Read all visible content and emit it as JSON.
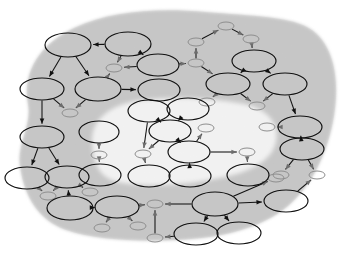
{
  "diagram": {
    "type": "node-link-diagram",
    "width": 352,
    "height": 258,
    "colors": {
      "background": "#ffffff",
      "region_fill": "#c9c9c9",
      "region_inner_fill": "#ffffff",
      "node_stroke": "#101010",
      "node_fill": "none",
      "leaf_stroke": "#8e8e8e",
      "edge_stroke": "#111111"
    },
    "regions": [
      {
        "name": "outer-shaded-region",
        "fill": "#c9c9c9",
        "path": "M 28 104 C 22 72, 40 44, 74 28 C 112 10, 160 8, 206 12 C 252 16, 292 16, 312 30 C 334 46, 340 80, 334 116 C 328 152, 312 186, 288 206 C 262 228, 222 238, 178 240 C 136 242, 96 240, 66 230 C 38 220, 24 196, 20 166 C 17 142, 32 126, 28 104 Z"
      },
      {
        "name": "inner-white-region",
        "fill": "#ffffff",
        "path": "M 92 140 C 92 118, 112 104, 142 100 C 176 96, 214 98, 244 104 C 268 109, 280 124, 276 142 C 272 160, 252 172, 220 178 C 186 185, 146 188, 118 182 C 98 178, 92 160, 92 140 Z"
      }
    ],
    "nodes": [
      {
        "id": "n1",
        "name": "node-top-left",
        "cx": 68,
        "cy": 45,
        "rx": 23,
        "ry": 12,
        "kind": "ellipse"
      },
      {
        "id": "n2",
        "name": "node-top-center",
        "cx": 128,
        "cy": 44,
        "rx": 23,
        "ry": 12,
        "kind": "ellipse"
      },
      {
        "id": "n3",
        "name": "leaf-top-center",
        "cx": 114,
        "cy": 68,
        "rx": 8,
        "ry": 4,
        "kind": "leaf"
      },
      {
        "id": "n4",
        "name": "node-upper-mid",
        "cx": 158,
        "cy": 65,
        "rx": 21,
        "ry": 11,
        "kind": "ellipse"
      },
      {
        "id": "n5",
        "name": "node-left-upper",
        "cx": 42,
        "cy": 89,
        "rx": 22,
        "ry": 11,
        "kind": "ellipse"
      },
      {
        "id": "n6",
        "name": "node-mid-left",
        "cx": 98,
        "cy": 89,
        "rx": 23,
        "ry": 12,
        "kind": "ellipse"
      },
      {
        "id": "n7",
        "name": "node-mid-right",
        "cx": 159,
        "cy": 90,
        "rx": 21,
        "ry": 11,
        "kind": "ellipse"
      },
      {
        "id": "n8",
        "name": "leaf-left-upper",
        "cx": 70,
        "cy": 113,
        "rx": 8,
        "ry": 4,
        "kind": "leaf"
      },
      {
        "id": "n9",
        "name": "leaf-top-right-a",
        "cx": 196,
        "cy": 42,
        "rx": 8,
        "ry": 4,
        "kind": "leaf"
      },
      {
        "id": "n10",
        "name": "leaf-top-right-b",
        "cx": 226,
        "cy": 26,
        "rx": 8,
        "ry": 4,
        "kind": "leaf"
      },
      {
        "id": "n11",
        "name": "leaf-top-right-c",
        "cx": 251,
        "cy": 39,
        "rx": 8,
        "ry": 4,
        "kind": "leaf"
      },
      {
        "id": "n12",
        "name": "leaf-right-upper",
        "cx": 196,
        "cy": 63,
        "rx": 8,
        "ry": 4,
        "kind": "leaf"
      },
      {
        "id": "n13",
        "name": "node-right-top",
        "cx": 254,
        "cy": 61,
        "rx": 22,
        "ry": 11,
        "kind": "ellipse"
      },
      {
        "id": "n14",
        "name": "node-right-mid-a",
        "cx": 228,
        "cy": 84,
        "rx": 22,
        "ry": 11,
        "kind": "ellipse"
      },
      {
        "id": "n15",
        "name": "node-right-mid-b",
        "cx": 285,
        "cy": 84,
        "rx": 22,
        "ry": 11,
        "kind": "ellipse"
      },
      {
        "id": "n16",
        "name": "leaf-right-mid-a",
        "cx": 207,
        "cy": 102,
        "rx": 8,
        "ry": 4,
        "kind": "leaf"
      },
      {
        "id": "n17",
        "name": "leaf-right-mid-b",
        "cx": 257,
        "cy": 106,
        "rx": 8,
        "ry": 4,
        "kind": "leaf"
      },
      {
        "id": "n18",
        "name": "node-right-lower-a",
        "cx": 300,
        "cy": 127,
        "rx": 22,
        "ry": 11,
        "kind": "ellipse"
      },
      {
        "id": "n19",
        "name": "leaf-right-lower",
        "cx": 267,
        "cy": 127,
        "rx": 8,
        "ry": 4,
        "kind": "leaf"
      },
      {
        "id": "n20",
        "name": "node-right-lower-b",
        "cx": 302,
        "cy": 149,
        "rx": 22,
        "ry": 11,
        "kind": "ellipse"
      },
      {
        "id": "n21",
        "name": "leaf-right-bottom-a",
        "cx": 281,
        "cy": 175,
        "rx": 8,
        "ry": 4,
        "kind": "leaf"
      },
      {
        "id": "n22",
        "name": "leaf-right-bottom-b",
        "cx": 317,
        "cy": 175,
        "rx": 8,
        "ry": 4,
        "kind": "leaf"
      },
      {
        "id": "n23",
        "name": "node-bottom-right",
        "cx": 286,
        "cy": 201,
        "rx": 22,
        "ry": 11,
        "kind": "ellipse"
      },
      {
        "id": "n24",
        "name": "node-left-mid",
        "cx": 42,
        "cy": 137,
        "rx": 22,
        "ry": 11,
        "kind": "ellipse"
      },
      {
        "id": "n25",
        "name": "node-left-lower-a",
        "cx": 27,
        "cy": 178,
        "rx": 22,
        "ry": 11,
        "kind": "ellipse"
      },
      {
        "id": "n26",
        "name": "node-left-lower-b",
        "cx": 67,
        "cy": 177,
        "rx": 22,
        "ry": 11,
        "kind": "ellipse"
      },
      {
        "id": "n27",
        "name": "leaf-bottom-left-a",
        "cx": 48,
        "cy": 196,
        "rx": 8,
        "ry": 4,
        "kind": "leaf"
      },
      {
        "id": "n28",
        "name": "leaf-bottom-left-b",
        "cx": 90,
        "cy": 192,
        "rx": 8,
        "ry": 4,
        "kind": "leaf"
      },
      {
        "id": "n29",
        "name": "node-bottom-left",
        "cx": 70,
        "cy": 208,
        "rx": 23,
        "ry": 12,
        "kind": "ellipse"
      },
      {
        "id": "n30",
        "name": "node-bottom-center",
        "cx": 117,
        "cy": 207,
        "rx": 22,
        "ry": 11,
        "kind": "ellipse"
      },
      {
        "id": "n31",
        "name": "leaf-bottom-center-a",
        "cx": 102,
        "cy": 228,
        "rx": 8,
        "ry": 4,
        "kind": "leaf"
      },
      {
        "id": "n32",
        "name": "leaf-bottom-center-b",
        "cx": 138,
        "cy": 226,
        "rx": 8,
        "ry": 4,
        "kind": "leaf"
      },
      {
        "id": "n33",
        "name": "leaf-bottom-hub",
        "cx": 155,
        "cy": 204,
        "rx": 8,
        "ry": 4,
        "kind": "leaf"
      },
      {
        "id": "n34",
        "name": "leaf-bottom-lower",
        "cx": 155,
        "cy": 238,
        "rx": 8,
        "ry": 4,
        "kind": "leaf"
      },
      {
        "id": "n35",
        "name": "node-bottom-hub",
        "cx": 215,
        "cy": 204,
        "rx": 23,
        "ry": 12,
        "kind": "ellipse"
      },
      {
        "id": "n36",
        "name": "node-bottom-child-a",
        "cx": 196,
        "cy": 234,
        "rx": 22,
        "ry": 11,
        "kind": "ellipse"
      },
      {
        "id": "n37",
        "name": "node-bottom-child-b",
        "cx": 239,
        "cy": 233,
        "rx": 22,
        "ry": 11,
        "kind": "ellipse"
      },
      {
        "id": "n38",
        "name": "leaf-inner-bottom-left",
        "cx": 276,
        "cy": 178,
        "rx": 8,
        "ry": 4,
        "kind": "leaf"
      },
      {
        "id": "n39",
        "name": "node-inner-left-top",
        "cx": 99,
        "cy": 132,
        "rx": 20,
        "ry": 11,
        "kind": "ellipse"
      },
      {
        "id": "n40",
        "name": "leaf-inner-left",
        "cx": 99,
        "cy": 155,
        "rx": 8,
        "ry": 4,
        "kind": "leaf"
      },
      {
        "id": "n41",
        "name": "node-inner-left-bottom",
        "cx": 100,
        "cy": 175,
        "rx": 21,
        "ry": 11,
        "kind": "ellipse"
      },
      {
        "id": "n42",
        "name": "node-inner-top-a",
        "cx": 149,
        "cy": 111,
        "rx": 21,
        "ry": 11,
        "kind": "ellipse"
      },
      {
        "id": "n43",
        "name": "node-inner-top-b",
        "cx": 188,
        "cy": 109,
        "rx": 21,
        "ry": 11,
        "kind": "ellipse"
      },
      {
        "id": "n44",
        "name": "node-inner-center",
        "cx": 170,
        "cy": 131,
        "rx": 21,
        "ry": 11,
        "kind": "ellipse"
      },
      {
        "id": "n45",
        "name": "leaf-inner-center",
        "cx": 143,
        "cy": 154,
        "rx": 8,
        "ry": 4,
        "kind": "leaf"
      },
      {
        "id": "n46",
        "name": "node-inner-bottom-a",
        "cx": 149,
        "cy": 176,
        "rx": 21,
        "ry": 11,
        "kind": "ellipse"
      },
      {
        "id": "n47",
        "name": "node-inner-right-center",
        "cx": 189,
        "cy": 152,
        "rx": 21,
        "ry": 11,
        "kind": "ellipse"
      },
      {
        "id": "n48",
        "name": "leaf-inner-right-top",
        "cx": 206,
        "cy": 128,
        "rx": 8,
        "ry": 4,
        "kind": "leaf"
      },
      {
        "id": "n49",
        "name": "node-inner-bottom-b",
        "cx": 190,
        "cy": 176,
        "rx": 21,
        "ry": 11,
        "kind": "ellipse"
      },
      {
        "id": "n50",
        "name": "leaf-inner-far-right",
        "cx": 247,
        "cy": 152,
        "rx": 8,
        "ry": 4,
        "kind": "leaf"
      },
      {
        "id": "n51",
        "name": "node-inner-far-right",
        "cx": 248,
        "cy": 175,
        "rx": 21,
        "ry": 11,
        "kind": "ellipse"
      }
    ],
    "edges": [
      {
        "from": "n2",
        "to": "n1",
        "name": "edge-n2-n1"
      },
      {
        "from": "n1",
        "to": "n5",
        "name": "edge-n1-n5"
      },
      {
        "from": "n1",
        "to": "n6",
        "name": "edge-n1-n6"
      },
      {
        "from": "n2",
        "to": "n3",
        "name": "edge-n2-n3"
      },
      {
        "from": "n2",
        "to": "n4",
        "name": "edge-n2-n4"
      },
      {
        "from": "n4",
        "to": "n3",
        "name": "edge-n4-n3"
      },
      {
        "from": "n6",
        "to": "n3",
        "name": "edge-n6-n3"
      },
      {
        "from": "n4",
        "to": "n12",
        "name": "edge-n4-n12"
      },
      {
        "from": "n6",
        "to": "n7",
        "name": "edge-n6-n7"
      },
      {
        "from": "n5",
        "to": "n8",
        "name": "edge-n5-n8"
      },
      {
        "from": "n6",
        "to": "n8",
        "name": "edge-n6-n8"
      },
      {
        "from": "n9",
        "to": "n10",
        "name": "edge-n9-n10"
      },
      {
        "from": "n10",
        "to": "n11",
        "name": "edge-n10-n11"
      },
      {
        "from": "n12",
        "to": "n9",
        "name": "edge-n12-n9"
      },
      {
        "from": "n11",
        "to": "n13",
        "name": "edge-n11-n13"
      },
      {
        "from": "n12",
        "to": "n14",
        "name": "edge-n12-n14"
      },
      {
        "from": "n13",
        "to": "n14",
        "name": "edge-n13-n14"
      },
      {
        "from": "n13",
        "to": "n15",
        "name": "edge-n13-n15"
      },
      {
        "from": "n14",
        "to": "n16",
        "name": "edge-n14-n16"
      },
      {
        "from": "n14",
        "to": "n17",
        "name": "edge-n14-n17"
      },
      {
        "from": "n15",
        "to": "n17",
        "name": "edge-n15-n17"
      },
      {
        "from": "n15",
        "to": "n18",
        "name": "edge-n15-n18"
      },
      {
        "from": "n18",
        "to": "n19",
        "name": "edge-n18-n19"
      },
      {
        "from": "n18",
        "to": "n20",
        "name": "edge-n18-n20"
      },
      {
        "from": "n20",
        "to": "n21",
        "name": "edge-n20-n21"
      },
      {
        "from": "n20",
        "to": "n22",
        "name": "edge-n20-n22"
      },
      {
        "from": "n23",
        "to": "n22",
        "name": "edge-n23-n22"
      },
      {
        "from": "n5",
        "to": "n24",
        "name": "edge-n5-n24"
      },
      {
        "from": "n24",
        "to": "n25",
        "name": "edge-n24-n25"
      },
      {
        "from": "n24",
        "to": "n26",
        "name": "edge-n24-n26"
      },
      {
        "from": "n25",
        "to": "n27",
        "name": "edge-n25-n27"
      },
      {
        "from": "n26",
        "to": "n27",
        "name": "edge-n26-n27"
      },
      {
        "from": "n26",
        "to": "n28",
        "name": "edge-n26-n28"
      },
      {
        "from": "n29",
        "to": "n26",
        "name": "edge-n29-n26"
      },
      {
        "from": "n30",
        "to": "n29",
        "name": "edge-n30-n29"
      },
      {
        "from": "n30",
        "to": "n31",
        "name": "edge-n30-n31"
      },
      {
        "from": "n30",
        "to": "n32",
        "name": "edge-n30-n32"
      },
      {
        "from": "n34",
        "to": "n33",
        "name": "edge-n34-n33"
      },
      {
        "from": "n30",
        "to": "n33",
        "name": "edge-n30-n33"
      },
      {
        "from": "n35",
        "to": "n33",
        "name": "edge-n35-n33"
      },
      {
        "from": "n36",
        "to": "n34",
        "name": "edge-n36-n34"
      },
      {
        "from": "n35",
        "to": "n36",
        "name": "edge-n35-n36"
      },
      {
        "from": "n35",
        "to": "n37",
        "name": "edge-n35-n37"
      },
      {
        "from": "n35",
        "to": "n23",
        "name": "edge-n35-n23"
      },
      {
        "from": "n35",
        "to": "n38",
        "name": "edge-n35-n38"
      },
      {
        "from": "n39",
        "to": "n40",
        "name": "edge-n39-n40"
      },
      {
        "from": "n40",
        "to": "n41",
        "name": "edge-n40-n41"
      },
      {
        "from": "n44",
        "to": "n42",
        "name": "edge-n44-n42"
      },
      {
        "from": "n44",
        "to": "n43",
        "name": "edge-n44-n43"
      },
      {
        "from": "n42",
        "to": "n45",
        "name": "edge-n42-n45"
      },
      {
        "from": "n44",
        "to": "n45",
        "name": "edge-n44-n45"
      },
      {
        "from": "n45",
        "to": "n46",
        "name": "edge-n45-n46"
      },
      {
        "from": "n47",
        "to": "n44",
        "name": "edge-n47-n44"
      },
      {
        "from": "n47",
        "to": "n48",
        "name": "edge-n47-n48"
      },
      {
        "from": "n47",
        "to": "n49",
        "name": "edge-n47-n49"
      },
      {
        "from": "n47",
        "to": "n50",
        "name": "edge-n47-n50"
      },
      {
        "from": "n50",
        "to": "n51",
        "name": "edge-n50-n51"
      }
    ]
  }
}
